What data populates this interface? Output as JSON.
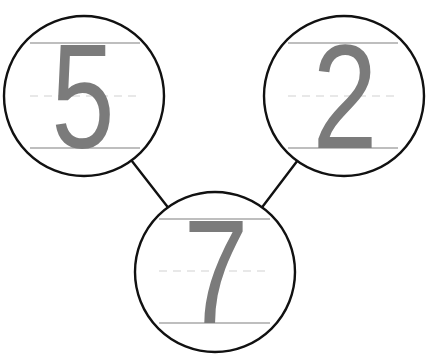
{
  "diagram": {
    "type": "number-bond",
    "parts": [
      {
        "id": "left-part",
        "value": "5"
      },
      {
        "id": "right-part",
        "value": "2"
      }
    ],
    "whole": {
      "id": "whole",
      "value": "7"
    },
    "colors": {
      "digit": "#7b7b7b",
      "circle_stroke": "#111111",
      "guide_solid": "#a9a9a9",
      "guide_dashed": "#d2d2d2",
      "background": "#ffffff"
    }
  }
}
